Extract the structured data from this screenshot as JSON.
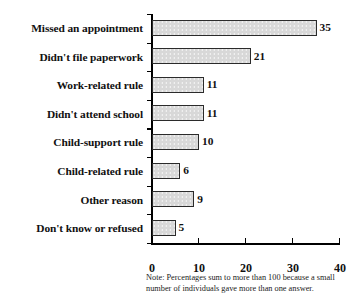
{
  "chart_data": {
    "type": "bar",
    "orientation": "horizontal",
    "title": "",
    "subtitle": "",
    "xlabel": "",
    "ylabel": "",
    "xlim": [
      0,
      40
    ],
    "xticks": [
      "0",
      "10",
      "20",
      "30",
      "40"
    ],
    "xtick_values": [
      0,
      10,
      20,
      30,
      40
    ],
    "grid": false,
    "legend": null,
    "categories": [
      "Missed an appointment",
      "Didn't file paperwork",
      "Work-related rule",
      "Didn't attend school",
      "Child-support rule",
      "Child-related rule",
      "Other reason",
      "Don't know or refused"
    ],
    "values": [
      35,
      21,
      11,
      11,
      10,
      6,
      9,
      5
    ],
    "value_labels": [
      "35",
      "21",
      "11",
      "11",
      "10",
      "6",
      "9",
      "5"
    ],
    "bar_fill_color": "#d8d8d8",
    "bar_border_color": "#2b2b2b",
    "axis_color": "#000000"
  },
  "note": {
    "line1": "Note: Percentages sum to more than 100 because a small",
    "line2": "number of individuals gave more than one answer."
  }
}
